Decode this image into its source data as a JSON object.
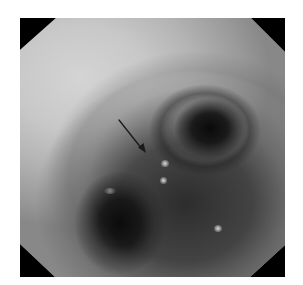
{
  "figure": {
    "type": "endoscopic-photograph",
    "colormode": "grayscale",
    "frame_shape": "octagon",
    "frame_background": "#000000",
    "page_background": "#ffffff",
    "annotation": {
      "kind": "arrow",
      "color": "#1a1a1a",
      "from": [
        119,
        120
      ],
      "to": [
        145,
        152
      ]
    },
    "features": [
      {
        "name": "right-lumen",
        "center": [
          205,
          130
        ]
      },
      {
        "name": "lower-left-lumen",
        "center": [
          120,
          220
        ]
      },
      {
        "name": "specular-highlights",
        "count": 3
      }
    ]
  }
}
